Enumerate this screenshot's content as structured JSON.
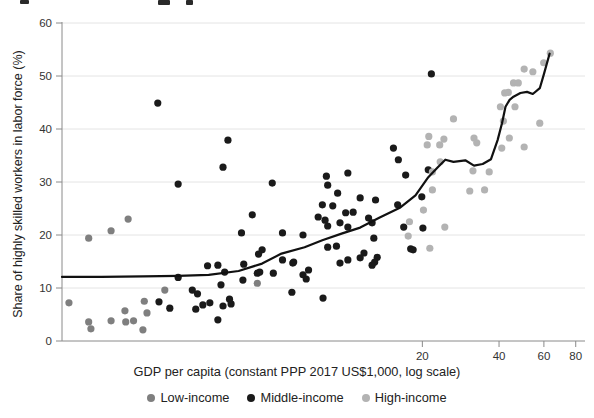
{
  "chart_data": {
    "type": "scatter",
    "title": "",
    "xlabel": "GDP per capita (constant PPP 2017 US$1,000, log scale)",
    "ylabel": "Share of highly skilled workers in labor force (%)",
    "x_scale": "log",
    "xlim": [
      0.77,
      87
    ],
    "ylim": [
      0,
      60
    ],
    "x_ticks": [
      20,
      40,
      60,
      80
    ],
    "y_ticks": [
      0,
      10,
      20,
      30,
      40,
      50,
      60
    ],
    "grid": "horizontal",
    "legend_position": "bottom",
    "colors": {
      "grid": "#e4e4e4",
      "axis": "#8a8a8a",
      "tick_label": "#333333",
      "trend_line": "#111111"
    },
    "series": [
      {
        "name": "Low-income",
        "color": "#7f7f7f",
        "points": [
          [
            0.82,
            7.2
          ],
          [
            0.98,
            3.6
          ],
          [
            1.0,
            2.3
          ],
          [
            1.2,
            3.8
          ],
          [
            1.36,
            5.7
          ],
          [
            1.37,
            3.6
          ],
          [
            1.47,
            3.8
          ],
          [
            1.6,
            2.1
          ],
          [
            1.62,
            7.5
          ],
          [
            1.66,
            5.3
          ],
          [
            1.95,
            9.6
          ],
          [
            1.4,
            23.0
          ],
          [
            1.2,
            20.8
          ],
          [
            0.98,
            19.4
          ],
          [
            4.5,
            10.9
          ]
        ]
      },
      {
        "name": "Middle-income",
        "color": "#1a1a1a",
        "points": [
          [
            1.83,
            44.9
          ],
          [
            3.45,
            37.9
          ],
          [
            3.3,
            32.8
          ],
          [
            2.2,
            29.6
          ],
          [
            5.15,
            29.8
          ],
          [
            8.4,
            31.1
          ],
          [
            8.5,
            29.4
          ],
          [
            10.2,
            31.7
          ],
          [
            15.4,
            36.4
          ],
          [
            16.1,
            34.2
          ],
          [
            21.7,
            50.4
          ],
          [
            9.3,
            27.9
          ],
          [
            11.4,
            27.0
          ],
          [
            13.1,
            26.6
          ],
          [
            8.1,
            25.7
          ],
          [
            8.9,
            25.5
          ],
          [
            10.0,
            24.2
          ],
          [
            10.7,
            24.3
          ],
          [
            7.8,
            23.4
          ],
          [
            8.3,
            22.8
          ],
          [
            8.5,
            21.7
          ],
          [
            9.5,
            22.3
          ],
          [
            10.2,
            21.5
          ],
          [
            12.3,
            23.2
          ],
          [
            12.7,
            22.3
          ],
          [
            16.0,
            25.7
          ],
          [
            17.2,
            31.3
          ],
          [
            19.9,
            27.2
          ],
          [
            21.1,
            32.3
          ],
          [
            16.9,
            21.5
          ],
          [
            20.1,
            21.3
          ],
          [
            5.65,
            20.4
          ],
          [
            6.8,
            20.0
          ],
          [
            12.9,
            19.4
          ],
          [
            4.7,
            17.2
          ],
          [
            8.5,
            17.7
          ],
          [
            9.2,
            17.9
          ],
          [
            18.0,
            17.4
          ],
          [
            18.4,
            17.2
          ],
          [
            11.8,
            16.6
          ],
          [
            13.3,
            15.8
          ],
          [
            13.0,
            14.9
          ],
          [
            5.65,
            15.3
          ],
          [
            6.2,
            14.7
          ],
          [
            9.5,
            14.7
          ],
          [
            10.2,
            15.3
          ],
          [
            11.4,
            15.7
          ],
          [
            12.7,
            14.3
          ],
          [
            4.55,
            16.4
          ],
          [
            3.98,
            14.5
          ],
          [
            4.5,
            12.8
          ],
          [
            4.6,
            13.0
          ],
          [
            5.2,
            12.8
          ],
          [
            3.95,
            11.5
          ],
          [
            6.25,
            14.9
          ],
          [
            6.8,
            12.5
          ],
          [
            7.15,
            13.4
          ],
          [
            7.0,
            11.7
          ],
          [
            6.15,
            9.2
          ],
          [
            8.15,
            8.1
          ],
          [
            3.35,
            13.0
          ],
          [
            3.5,
            7.9
          ],
          [
            3.55,
            7.0
          ],
          [
            2.2,
            12.0
          ],
          [
            4.3,
            23.8
          ],
          [
            3.9,
            20.4
          ],
          [
            1.85,
            7.4
          ],
          [
            2.04,
            6.2
          ],
          [
            2.5,
            9.6
          ],
          [
            2.62,
            8.9
          ],
          [
            2.58,
            6.0
          ],
          [
            2.75,
            6.8
          ],
          [
            2.93,
            7.2
          ],
          [
            2.87,
            14.2
          ],
          [
            3.15,
            14.3
          ],
          [
            3.24,
            10.6
          ],
          [
            3.15,
            4.0
          ],
          [
            3.3,
            6.6
          ]
        ]
      },
      {
        "name": "High-income",
        "color": "#b3b3b3",
        "points": [
          [
            21.9,
            31.9
          ],
          [
            23.5,
            33.8
          ],
          [
            31.6,
            32.1
          ],
          [
            36.6,
            31.9
          ],
          [
            21.9,
            28.5
          ],
          [
            30.7,
            28.3
          ],
          [
            35.1,
            28.5
          ],
          [
            20.2,
            24.7
          ],
          [
            24.5,
            21.5
          ],
          [
            17.8,
            22.5
          ],
          [
            17.6,
            19.8
          ],
          [
            21.4,
            17.5
          ],
          [
            26.5,
            41.9
          ],
          [
            21.2,
            38.6
          ],
          [
            20.9,
            37.0
          ],
          [
            23.4,
            37.0
          ],
          [
            24.3,
            38.1
          ],
          [
            31.9,
            38.3
          ],
          [
            32.7,
            37.4
          ],
          [
            41.0,
            36.4
          ],
          [
            43.9,
            38.3
          ],
          [
            50.2,
            36.6
          ],
          [
            57.8,
            41.1
          ],
          [
            40.5,
            44.2
          ],
          [
            46.2,
            44.2
          ],
          [
            41.6,
            41.5
          ],
          [
            42.1,
            46.8
          ],
          [
            43.5,
            46.9
          ],
          [
            45.6,
            48.7
          ],
          [
            47.6,
            48.7
          ],
          [
            50.2,
            51.3
          ],
          [
            54.3,
            50.8
          ],
          [
            59.9,
            52.5
          ],
          [
            63.6,
            54.3
          ]
        ]
      }
    ],
    "trend_line": {
      "name": "lowess-trend",
      "color": "#111111",
      "points": [
        [
          0.77,
          12.1
        ],
        [
          1.1,
          12.1
        ],
        [
          1.6,
          12.2
        ],
        [
          2.2,
          12.3
        ],
        [
          2.9,
          12.5
        ],
        [
          3.8,
          13.2
        ],
        [
          4.7,
          14.6
        ],
        [
          5.6,
          16.5
        ],
        [
          6.9,
          17.7
        ],
        [
          8.1,
          19.0
        ],
        [
          9.7,
          20.3
        ],
        [
          11.4,
          21.4
        ],
        [
          13.6,
          23.3
        ],
        [
          16.4,
          25.2
        ],
        [
          18.8,
          27.5
        ],
        [
          21.1,
          30.9
        ],
        [
          23.0,
          32.8
        ],
        [
          24.6,
          34.2
        ],
        [
          26.5,
          33.8
        ],
        [
          29.5,
          34.1
        ],
        [
          31.9,
          33.1
        ],
        [
          34.5,
          33.4
        ],
        [
          37.2,
          34.3
        ],
        [
          39.5,
          37.9
        ],
        [
          41.1,
          41.1
        ],
        [
          42.4,
          44.2
        ],
        [
          44.0,
          45.5
        ],
        [
          45.6,
          46.1
        ],
        [
          48.5,
          46.8
        ],
        [
          51.5,
          47.0
        ],
        [
          54.3,
          46.6
        ],
        [
          57.8,
          47.7
        ],
        [
          59.9,
          50.2
        ],
        [
          63.2,
          54.2
        ]
      ]
    }
  }
}
